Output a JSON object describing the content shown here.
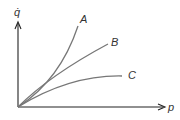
{
  "diagram": {
    "y_axis_label": "q̇",
    "x_axis_label": "p",
    "curves": [
      {
        "label": "A",
        "shape": "convex"
      },
      {
        "label": "B",
        "shape": "linear"
      },
      {
        "label": "C",
        "shape": "concave"
      }
    ],
    "colors": {
      "axis": "#222222",
      "curve": "#777777",
      "text": "#333333"
    }
  }
}
